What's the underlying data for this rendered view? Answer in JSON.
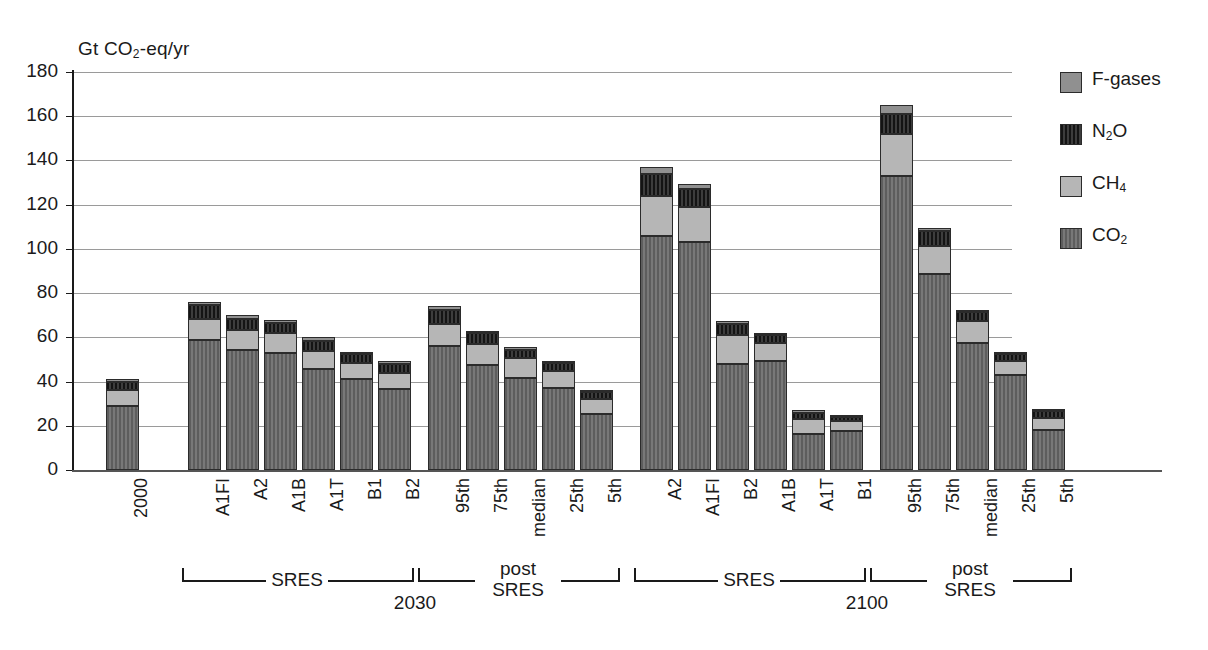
{
  "chart_data": {
    "type": "bar",
    "title": "",
    "subtitle": "",
    "xlabel": "",
    "ylabel": "Gt CO2-eq/yr",
    "ylabel_rich": {
      "pre": "Gt CO",
      "sub": "2",
      "post": "-eq/yr"
    },
    "ylim": [
      0,
      180
    ],
    "yticks": [
      0,
      20,
      40,
      60,
      80,
      100,
      120,
      140,
      160,
      180
    ],
    "ytick_labels": [
      "0",
      "20",
      "40",
      "60",
      "80",
      "100",
      "120",
      "140",
      "160",
      "180"
    ],
    "grid": true,
    "grid_axis": "y",
    "stacked": true,
    "legend_position": "right",
    "series": [
      {
        "name": "CO2",
        "key": "co2",
        "label_rich": {
          "pre": "CO",
          "sub": "2",
          "post": ""
        },
        "color": "#6b6b6b",
        "pattern": "vertical-stripes"
      },
      {
        "name": "CH4",
        "key": "ch4",
        "label_rich": {
          "pre": "CH",
          "sub": "4",
          "post": ""
        },
        "color": "#b6b6b6",
        "pattern": "solid"
      },
      {
        "name": "N2O",
        "key": "n2o",
        "label_rich": {
          "pre": "N",
          "sub": "2",
          "post": "O"
        },
        "color": "#262626",
        "pattern": "vertical-stripes"
      },
      {
        "name": "F-gases",
        "key": "fgas",
        "label_rich": {
          "pre": "F-gases",
          "sub": "",
          "post": ""
        },
        "color": "#909090",
        "pattern": "solid"
      }
    ],
    "legend_order": [
      "F-gases",
      "N2O",
      "CH4",
      "CO2"
    ],
    "categories": [
      "2000",
      "A1FI",
      "A2",
      "A1B",
      "A1T",
      "B1",
      "B2",
      "95th",
      "75th",
      "median",
      "25th",
      "5th",
      "A2",
      "A1FI",
      "B2",
      "A1B",
      "A1T",
      "B1",
      "95th",
      "75th",
      "median",
      "25th",
      "5th"
    ],
    "bars": [
      {
        "label": "2000",
        "group": "observed",
        "x_px": 106,
        "co2": 29.0,
        "ch4": 7.0,
        "n2o": 4.0,
        "fgas": 1.0,
        "total": 41.0
      },
      {
        "label": "A1FI",
        "group": "SRES 2030",
        "x_px": 188,
        "co2": 59.0,
        "ch4": 9.5,
        "n2o": 6.0,
        "fgas": 1.5,
        "total": 76.0
      },
      {
        "label": "A2",
        "group": "SRES 2030",
        "x_px": 226,
        "co2": 54.5,
        "ch4": 9.0,
        "n2o": 5.0,
        "fgas": 1.5,
        "total": 70.0
      },
      {
        "label": "A1B",
        "group": "SRES 2030",
        "x_px": 264,
        "co2": 53.0,
        "ch4": 9.0,
        "n2o": 4.5,
        "fgas": 1.5,
        "total": 68.0
      },
      {
        "label": "A1T",
        "group": "SRES 2030",
        "x_px": 302,
        "co2": 45.5,
        "ch4": 8.5,
        "n2o": 4.5,
        "fgas": 1.5,
        "total": 60.0
      },
      {
        "label": "B1",
        "group": "SRES 2030",
        "x_px": 340,
        "co2": 41.0,
        "ch4": 7.5,
        "n2o": 4.0,
        "fgas": 1.0,
        "total": 53.5
      },
      {
        "label": "B2",
        "group": "SRES 2030",
        "x_px": 378,
        "co2": 36.5,
        "ch4": 7.5,
        "n2o": 4.0,
        "fgas": 1.5,
        "total": 49.5
      },
      {
        "label": "95th",
        "group": "post SRES 2030",
        "x_px": 428,
        "co2": 56.0,
        "ch4": 10.0,
        "n2o": 6.5,
        "fgas": 1.5,
        "total": 74.0
      },
      {
        "label": "75th",
        "group": "post SRES 2030",
        "x_px": 466,
        "co2": 47.5,
        "ch4": 9.5,
        "n2o": 5.0,
        "fgas": 1.0,
        "total": 63.0
      },
      {
        "label": "median",
        "group": "post SRES 2030",
        "x_px": 504,
        "co2": 41.5,
        "ch4": 9.0,
        "n2o": 4.0,
        "fgas": 1.0,
        "total": 55.5
      },
      {
        "label": "25th",
        "group": "post SRES 2030",
        "x_px": 542,
        "co2": 37.0,
        "ch4": 8.0,
        "n2o": 3.5,
        "fgas": 1.0,
        "total": 49.5
      },
      {
        "label": "5th",
        "group": "post SRES 2030",
        "x_px": 580,
        "co2": 25.5,
        "ch4": 6.5,
        "n2o": 3.5,
        "fgas": 0.5,
        "total": 36.0
      },
      {
        "label": "A2",
        "group": "SRES 2100",
        "x_px": 640,
        "co2": 106.0,
        "ch4": 18.0,
        "n2o": 10.0,
        "fgas": 3.0,
        "total": 137.0
      },
      {
        "label": "A1FI",
        "group": "SRES 2100",
        "x_px": 678,
        "co2": 103.0,
        "ch4": 16.0,
        "n2o": 8.0,
        "fgas": 2.5,
        "total": 129.5
      },
      {
        "label": "B2",
        "group": "SRES 2100",
        "x_px": 716,
        "co2": 48.0,
        "ch4": 13.0,
        "n2o": 5.0,
        "fgas": 1.5,
        "total": 67.5
      },
      {
        "label": "A1B",
        "group": "SRES 2100",
        "x_px": 754,
        "co2": 49.5,
        "ch4": 8.0,
        "n2o": 3.5,
        "fgas": 1.0,
        "total": 62.0
      },
      {
        "label": "A1T",
        "group": "SRES 2100",
        "x_px": 792,
        "co2": 16.5,
        "ch4": 6.5,
        "n2o": 3.0,
        "fgas": 1.0,
        "total": 27.0
      },
      {
        "label": "B1",
        "group": "SRES 2100",
        "x_px": 830,
        "co2": 17.5,
        "ch4": 4.5,
        "n2o": 2.0,
        "fgas": 0.5,
        "total": 24.5
      },
      {
        "label": "95th",
        "group": "post SRES 2100",
        "x_px": 880,
        "co2": 133.0,
        "ch4": 19.0,
        "n2o": 9.0,
        "fgas": 4.0,
        "total": 165.0
      },
      {
        "label": "75th",
        "group": "post SRES 2100",
        "x_px": 918,
        "co2": 88.5,
        "ch4": 13.0,
        "n2o": 6.5,
        "fgas": 1.5,
        "total": 109.5
      },
      {
        "label": "median",
        "group": "post SRES 2100",
        "x_px": 956,
        "co2": 57.5,
        "ch4": 10.0,
        "n2o": 4.0,
        "fgas": 1.0,
        "total": 72.5
      },
      {
        "label": "25th",
        "group": "post SRES 2100",
        "x_px": 994,
        "co2": 43.0,
        "ch4": 6.5,
        "n2o": 3.0,
        "fgas": 0.5,
        "total": 53.0
      },
      {
        "label": "5th",
        "group": "post SRES 2100",
        "x_px": 1032,
        "co2": 18.0,
        "ch4": 5.5,
        "n2o": 3.0,
        "fgas": 0.5,
        "total": 27.0
      }
    ],
    "group_brackets": [
      {
        "label": "SRES",
        "label_lines": [
          "SRES"
        ],
        "left_px": 182,
        "right_px": 412,
        "year": "2030"
      },
      {
        "label": "post SRES",
        "label_lines": [
          "post",
          "SRES"
        ],
        "left_px": 418,
        "right_px": 618,
        "year": ""
      },
      {
        "label": "SRES",
        "label_lines": [
          "SRES"
        ],
        "left_px": 634,
        "right_px": 864,
        "year": "2100"
      },
      {
        "label": "post SRES",
        "label_lines": [
          "post",
          "SRES"
        ],
        "left_px": 870,
        "right_px": 1070,
        "year": ""
      }
    ],
    "year_labels": [
      {
        "text": "2030",
        "center_px": 415
      },
      {
        "text": "2100",
        "center_px": 867
      }
    ]
  }
}
